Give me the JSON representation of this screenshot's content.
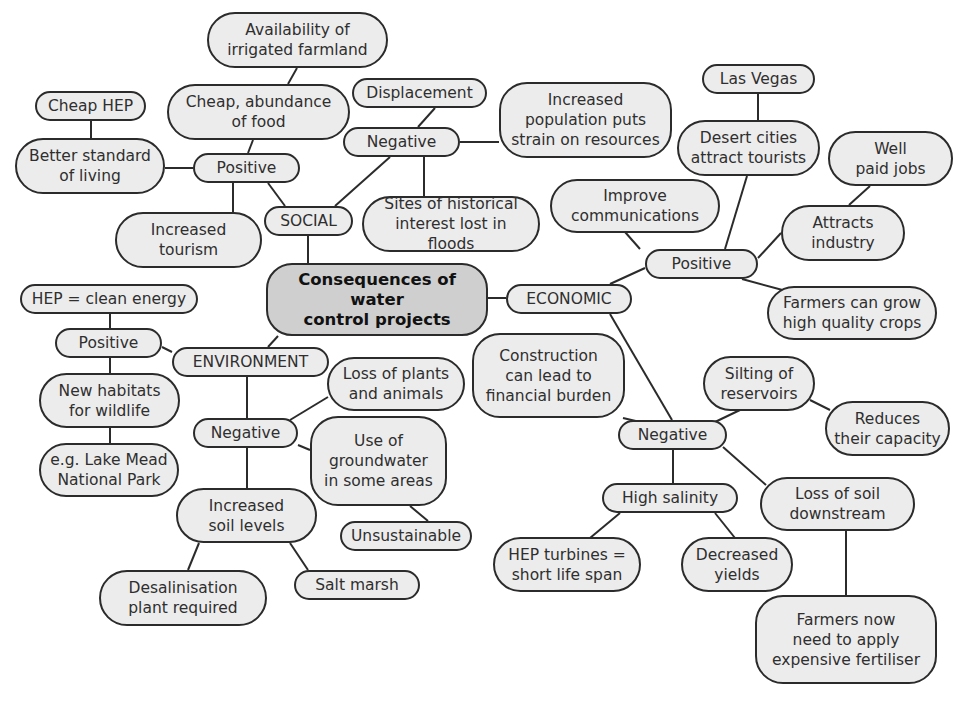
{
  "center": {
    "label": "Consequences of water\ncontrol projects"
  },
  "branches": {
    "social": {
      "label": "SOCIAL",
      "positive": {
        "label": "Positive",
        "items": [
          "Cheap, abundance\nof food",
          "Better standard\nof living",
          "Increased\ntourism"
        ],
        "sub": {
          "availability": "Availability of\nirrigated farmland",
          "cheap_hep": "Cheap HEP"
        }
      },
      "negative": {
        "label": "Negative",
        "items": [
          "Displacement",
          "Increased\npopulation puts\nstrain on resources",
          "Sites of historical\ninterest lost in floods"
        ]
      }
    },
    "economic": {
      "label": "ECONOMIC",
      "positive": {
        "label": "Positive",
        "items": [
          "Desert cities\nattract tourists",
          "Improve\ncommunications",
          "Attracts\nindustry",
          "Farmers can grow\nhigh quality crops"
        ],
        "sub": {
          "las_vegas": "Las Vegas",
          "well_paid": "Well\npaid jobs"
        }
      },
      "negative": {
        "label": "Negative",
        "items": [
          "Construction\ncan lead to\nfinancial burden",
          "Silting of\nreservoirs",
          "High salinity",
          "Loss of soil\ndownstream"
        ],
        "sub": {
          "reduces": "Reduces\ntheir capacity",
          "hep_turbines": "HEP turbines =\nshort life span",
          "decreased_yields": "Decreased\nyields",
          "farmers_now": "Farmers now\nneed to apply\nexpensive fertiliser"
        }
      }
    },
    "environment": {
      "label": "ENVIRONMENT",
      "positive": {
        "label": "Positive",
        "items": [
          "HEP = clean energy",
          "New habitats\nfor wildlife"
        ],
        "sub": {
          "lake_mead": "e.g. Lake Mead\nNational Park"
        }
      },
      "negative": {
        "label": "Negative",
        "items": [
          "Loss of plants\nand animals",
          "Use of\ngroundwater\nin some areas",
          "Increased\nsoil levels"
        ],
        "sub": {
          "unsustainable": "Unsustainable",
          "desalinisation": "Desalinisation\nplant required",
          "salt_marsh": "Salt marsh"
        }
      }
    }
  },
  "colors": {
    "node_fill": "#ececec",
    "center_fill": "#cfcfcf",
    "stroke": "#2b2b2b"
  }
}
